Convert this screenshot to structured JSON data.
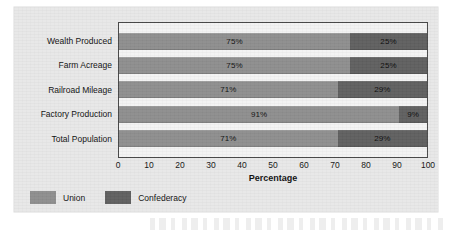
{
  "chart_data": {
    "type": "bar",
    "orientation": "horizontal",
    "stacked": true,
    "stack_mode": "percent",
    "title": "",
    "subtitle": "",
    "xlabel": "Percentage",
    "ylabel": "",
    "xlim": [
      0,
      100
    ],
    "xticks": [
      0,
      10,
      20,
      30,
      40,
      50,
      60,
      70,
      80,
      90,
      100
    ],
    "xticklabels": [
      "0",
      "10",
      "20",
      "30",
      "40",
      "50",
      "60",
      "70",
      "80",
      "90",
      "100"
    ],
    "grid": false,
    "legend_position": "bottom-left",
    "categories": [
      "Wealth Produced",
      "Farm Acreage",
      "Railroad Mileage",
      "Factory Production",
      "Total Population"
    ],
    "series": [
      {
        "name": "Union",
        "color": "#8e8e8e",
        "values": [
          75,
          75,
          71,
          91,
          71
        ],
        "labels": [
          "75%",
          "75%",
          "71%",
          "91%",
          "71%"
        ]
      },
      {
        "name": "Confederacy",
        "color": "#606060",
        "values": [
          25,
          25,
          29,
          9,
          29
        ],
        "labels": [
          "25%",
          "25%",
          "29%",
          "9%",
          "29%"
        ]
      }
    ]
  },
  "legend": {
    "items": [
      {
        "label": "Union",
        "color": "#8e8e8e"
      },
      {
        "label": "Confederacy",
        "color": "#606060"
      }
    ]
  },
  "colors": {
    "union": "#8e8e8e",
    "confederacy": "#606060",
    "panel_background": "#e8e8e8",
    "plot_background": "#f3f3f3",
    "plot_border": "#4a4a4a",
    "text": "#111111"
  }
}
